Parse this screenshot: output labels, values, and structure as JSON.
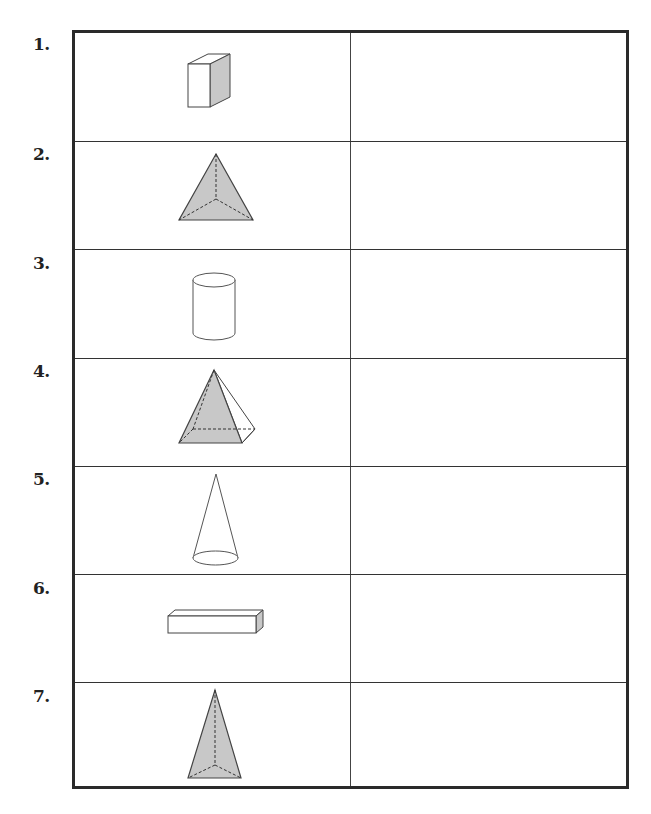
{
  "worksheet": {
    "rows": [
      {
        "number": "1.",
        "shape": "cube",
        "answer": ""
      },
      {
        "number": "2.",
        "shape": "triangular-pyramid",
        "answer": ""
      },
      {
        "number": "3.",
        "shape": "cylinder",
        "answer": ""
      },
      {
        "number": "4.",
        "shape": "square-pyramid",
        "answer": ""
      },
      {
        "number": "5.",
        "shape": "cone",
        "answer": ""
      },
      {
        "number": "6.",
        "shape": "rectangular-prism",
        "answer": ""
      },
      {
        "number": "7.",
        "shape": "tall-triangular-pyramid",
        "answer": ""
      }
    ]
  },
  "colors": {
    "border": "#2a2a2a",
    "shade": "#c8c8c8",
    "line": "#444444"
  }
}
